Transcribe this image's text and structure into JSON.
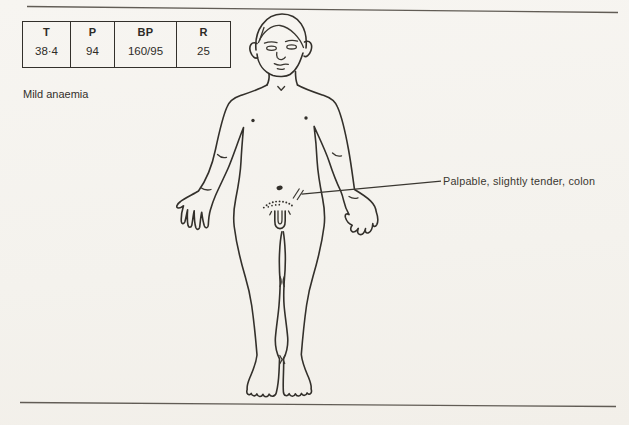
{
  "colors": {
    "paper": "#f5f3ef",
    "ink": "#33302b",
    "rule": "#615c55"
  },
  "vitals_table": {
    "columns": [
      {
        "label": "T",
        "value": "38·4"
      },
      {
        "label": "P",
        "value": "94"
      },
      {
        "label": "BP",
        "value": "160/95"
      },
      {
        "label": "R",
        "value": "25"
      }
    ]
  },
  "notes": {
    "finding": "Mild anaemia"
  },
  "annotation": {
    "label": "Palpable, slightly tender, colon"
  },
  "figure": {
    "icon": "male-body-anterior-outline-icon"
  }
}
